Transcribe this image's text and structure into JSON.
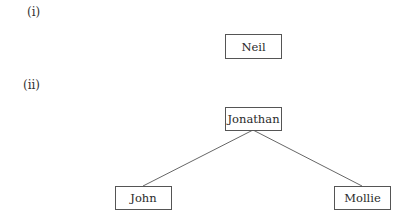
{
  "diagrams": [
    {
      "label": "(i)",
      "nodes": [
        {
          "id": "neil",
          "text": "Neil"
        }
      ],
      "edges": []
    },
    {
      "label": "(ii)",
      "nodes": [
        {
          "id": "jonathan",
          "text": "Jonathan"
        },
        {
          "id": "john",
          "text": "John"
        },
        {
          "id": "mollie",
          "text": "Mollie"
        }
      ],
      "edges": [
        {
          "from": "jonathan",
          "to": "john"
        },
        {
          "from": "jonathan",
          "to": "mollie"
        }
      ]
    }
  ],
  "colors": {
    "border": "#555555",
    "text": "#2a2a2a",
    "background": "#ffffff"
  }
}
